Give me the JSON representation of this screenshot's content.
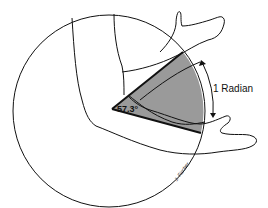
{
  "diagram": {
    "angle_label": "57.3°",
    "arc_label": "1 Radian",
    "signature": "J. Fischer",
    "colors": {
      "line": "#111111",
      "wedge_fill": "#9a9a9a",
      "background": "#ffffff"
    }
  }
}
